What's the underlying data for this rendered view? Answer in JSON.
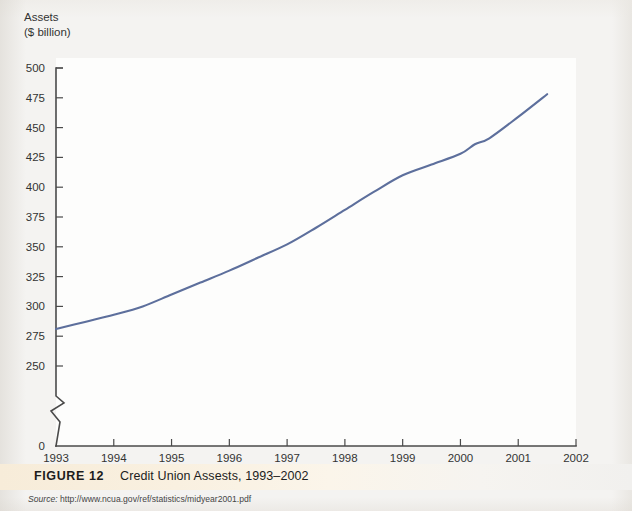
{
  "figure": {
    "axis_title_line1": "Assets",
    "axis_title_line2": "($ billion)",
    "caption_label": "FIGURE 12",
    "caption_title": "Credit Union Assests, 1993–2002",
    "source_label": "Source:",
    "source_url": "http://www.ncua.gov/ref/statistics/midyear2001.pdf",
    "line_color": "#5d6f9c",
    "axis_color": "#4a4a4a",
    "caption_band_color": "#f8eedb",
    "plot_background": "#fdfdfc",
    "page_background": "#f4f3f1"
  },
  "chart_data": {
    "type": "line",
    "title": "Credit Union Assests, 1993–2002",
    "xlabel": "",
    "ylabel": "Assets ($ billion)",
    "xlim": [
      1993,
      2002
    ],
    "ylim": [
      250,
      500
    ],
    "y_axis_break": true,
    "y_break_between": [
      0,
      250
    ],
    "grid": false,
    "legend": "none",
    "ytick_labels": [
      "500",
      "475",
      "450",
      "425",
      "400",
      "375",
      "350",
      "325",
      "300",
      "275",
      "250",
      "0"
    ],
    "ytick_values": [
      500,
      475,
      450,
      425,
      400,
      375,
      350,
      325,
      300,
      275,
      250,
      0
    ],
    "xtick_labels": [
      "1993",
      "1994",
      "1995",
      "1996",
      "1997",
      "1998",
      "1999",
      "2000",
      "2001",
      "2002"
    ],
    "xtick_values": [
      1993,
      1994,
      1995,
      1996,
      1997,
      1998,
      1999,
      2000,
      2001,
      2002
    ],
    "series": [
      {
        "name": "Credit Union Assets",
        "color": "#5d6f9c",
        "x": [
          1993,
          1993.5,
          1994,
          1994.5,
          1995,
          1995.5,
          1996,
          1996.5,
          1997,
          1997.5,
          1998,
          1998.5,
          1999,
          1999.5,
          2000,
          2000.25,
          2000.5,
          2001,
          2001.5
        ],
        "values": [
          281,
          287,
          293,
          300,
          310,
          320,
          330,
          341,
          352,
          366,
          381,
          396,
          410,
          419,
          428,
          436,
          441,
          459,
          478
        ]
      }
    ]
  }
}
